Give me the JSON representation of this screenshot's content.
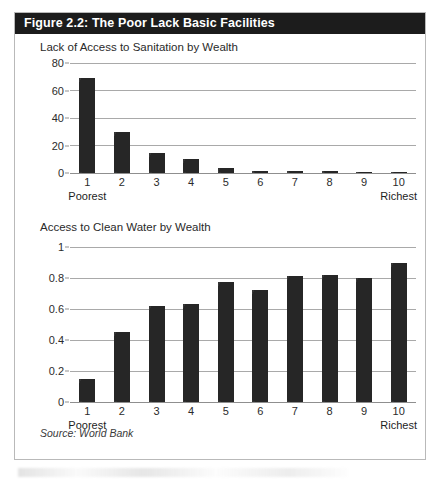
{
  "figure": {
    "title": "Figure 2.2: The Poor Lack Basic Facilities",
    "source": "Source: World Bank",
    "border_color": "#b9b9b9",
    "title_bar_color": "#1c1c1c",
    "bar_color": "#262626",
    "gridline_color": "#a9a9a9"
  },
  "chart_data": [
    {
      "type": "bar",
      "id": "sanitation",
      "title": "Lack of Access to Sanitation by Wealth",
      "xlabel": "",
      "ylabel": "",
      "categories": [
        "1",
        "2",
        "3",
        "4",
        "5",
        "6",
        "7",
        "8",
        "9",
        "10"
      ],
      "values": [
        69,
        30,
        14.5,
        10.5,
        3.5,
        1.2,
        1.3,
        1.2,
        0.6,
        0.7
      ],
      "ylim": [
        0,
        80
      ],
      "yticks": [
        0,
        20,
        40,
        60,
        80
      ],
      "ytick_labels": [
        "0",
        "20",
        "40",
        "60",
        "80"
      ],
      "grid": true,
      "legend": "none",
      "axis_end_labels": {
        "left": "Poorest",
        "right": "Richest"
      }
    },
    {
      "type": "bar",
      "id": "water",
      "title": "Access to Clean Water by Wealth",
      "xlabel": "",
      "ylabel": "",
      "categories": [
        "1",
        "2",
        "3",
        "4",
        "5",
        "6",
        "7",
        "8",
        "9",
        "10"
      ],
      "values": [
        0.15,
        0.45,
        0.62,
        0.63,
        0.775,
        0.72,
        0.81,
        0.82,
        0.8,
        0.895
      ],
      "ylim": [
        0,
        1
      ],
      "yticks": [
        0,
        0.2,
        0.4,
        0.6,
        0.8,
        1
      ],
      "ytick_labels": [
        "0",
        "0.2",
        "0.4",
        "0.6",
        "0.8",
        "1"
      ],
      "grid": true,
      "legend": "none",
      "axis_end_labels": {
        "left": "Poorest",
        "right": "Richest"
      }
    }
  ]
}
